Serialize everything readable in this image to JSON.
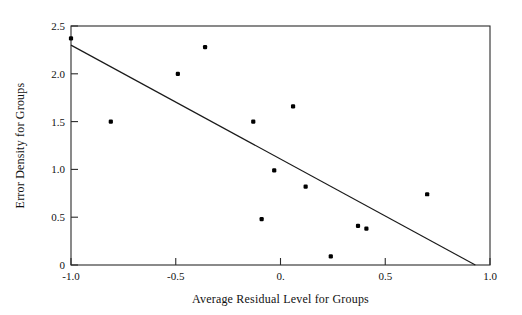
{
  "chart_data": {
    "type": "scatter",
    "title": "",
    "xlabel": "Average Residual Level for Groups",
    "ylabel": "Error Density for Groups",
    "xlim": [
      -1.0,
      1.0
    ],
    "ylim": [
      0,
      2.5
    ],
    "grid": false,
    "legend": false,
    "x_ticks": [
      -1.0,
      -0.5,
      0.0,
      0.5,
      1.0
    ],
    "x_tick_labels": [
      "-1.0",
      "-0.5",
      "0.",
      "0.5",
      "1.0"
    ],
    "y_ticks": [
      0,
      0.5,
      1.0,
      1.5,
      2.0,
      2.5
    ],
    "y_tick_labels": [
      "0",
      "0.5",
      "1.0",
      "1.5",
      "2.0",
      "2.5"
    ],
    "point_color": "#000000",
    "line_color": "#1a1a1a",
    "axis_color": "#2b2b2b",
    "background_color": "#ffffff",
    "points": [
      {
        "x": -1.0,
        "y": 2.37
      },
      {
        "x": -0.81,
        "y": 1.5
      },
      {
        "x": -0.49,
        "y": 2.0
      },
      {
        "x": -0.36,
        "y": 2.28
      },
      {
        "x": -0.13,
        "y": 1.5
      },
      {
        "x": -0.09,
        "y": 0.48
      },
      {
        "x": -0.03,
        "y": 0.99
      },
      {
        "x": 0.06,
        "y": 1.66
      },
      {
        "x": 0.12,
        "y": 0.82
      },
      {
        "x": 0.24,
        "y": 0.09
      },
      {
        "x": 0.37,
        "y": 0.41
      },
      {
        "x": 0.41,
        "y": 0.38
      },
      {
        "x": 0.7,
        "y": 0.74
      }
    ],
    "fit_line": {
      "name": "regression-line",
      "x_start": -1.0,
      "y_start": 2.3,
      "x_end": 0.93,
      "y_end": 0.0
    }
  }
}
